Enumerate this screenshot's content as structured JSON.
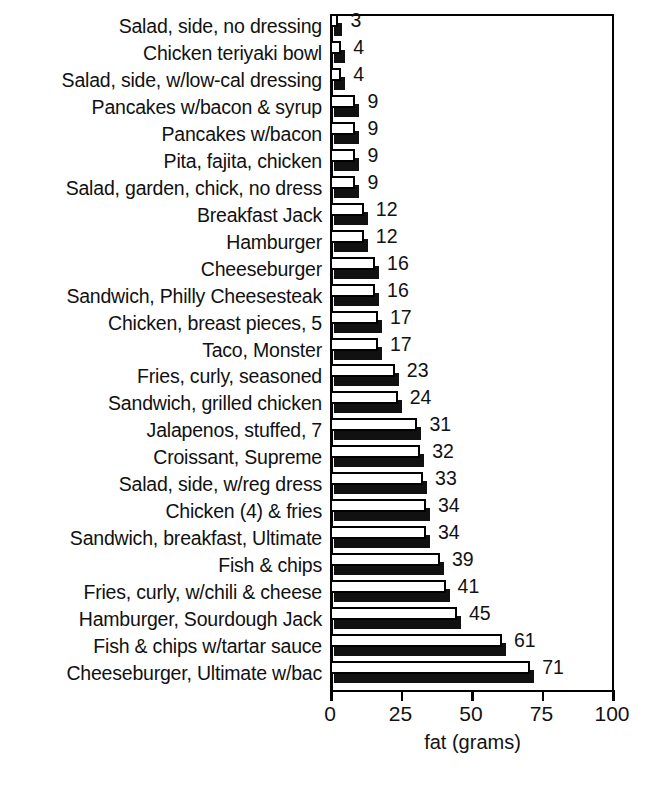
{
  "chart_data": {
    "type": "bar",
    "orientation": "horizontal",
    "title": "",
    "xlabel": "fat (grams)",
    "ylabel": "",
    "xlim": [
      0,
      100
    ],
    "xticks": [
      0,
      25,
      50,
      75,
      100
    ],
    "xticklabels": [
      "0",
      "25",
      "50",
      "75",
      "100"
    ],
    "grid": false,
    "legend": null,
    "bar_style": "3d-white-face-with-black-shadow",
    "show_value_labels": true,
    "categories": [
      "Salad, side, no dressing",
      "Chicken teriyaki bowl",
      "Salad, side, w/low-cal dressing",
      "Pancakes w/bacon & syrup",
      "Pancakes w/bacon",
      "Pita, fajita, chicken",
      "Salad, garden, chick, no dress",
      "Breakfast Jack",
      "Hamburger",
      "Cheeseburger",
      "Sandwich, Philly Cheesesteak",
      "Chicken, breast pieces, 5",
      "Taco, Monster",
      "Fries, curly, seasoned",
      "Sandwich, grilled chicken",
      "Jalapenos, stuffed, 7",
      "Croissant, Supreme",
      "Salad, side, w/reg dress",
      "Chicken (4) & fries",
      "Sandwich, breakfast, Ultimate",
      "Fish & chips",
      "Fries, curly, w/chili & cheese",
      "Hamburger, Sourdough Jack",
      "Fish & chips w/tartar sauce",
      "Cheeseburger, Ultimate w/bac"
    ],
    "values": [
      3,
      4,
      4,
      9,
      9,
      9,
      9,
      12,
      12,
      16,
      16,
      17,
      17,
      23,
      24,
      31,
      32,
      33,
      34,
      34,
      39,
      41,
      45,
      61,
      71
    ],
    "value_labels": [
      "3",
      "4",
      "4",
      "9",
      "9",
      "9",
      "9",
      "12",
      "12",
      "16",
      "16",
      "17",
      "17",
      "23",
      "24",
      "31",
      "32",
      "33",
      "34",
      "34",
      "39",
      "41",
      "45",
      "61",
      "71"
    ],
    "colors": {
      "bar_face": "#ffffff",
      "bar_outline": "#000000",
      "bar_shadow": "#111111",
      "axis": "#000000",
      "text": "#111111",
      "background": "#ffffff"
    }
  }
}
